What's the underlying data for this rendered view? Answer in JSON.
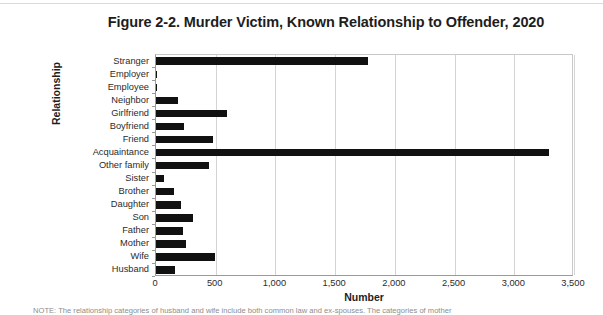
{
  "figure": {
    "title": "Figure 2-2. Murder Victim, Known Relationship to Offender, 2020",
    "note": "NOTE: The relationship categories of husband and wife include both common law and ex-spouses. The categories of mother"
  },
  "chart_data": {
    "type": "bar",
    "orientation": "horizontal",
    "title": "Figure 2-2. Murder Victim, Known Relationship to Offender, 2020",
    "xlabel": "Number",
    "ylabel": "Relationship",
    "xlim": [
      0,
      3500
    ],
    "xticks": [
      0,
      500,
      1000,
      1500,
      2000,
      2500,
      3000,
      3500
    ],
    "xtick_labels": [
      "0",
      "500",
      "1,000",
      "1,500",
      "2,000",
      "2,500",
      "3,000",
      "3,500"
    ],
    "grid": "vertical",
    "legend": "none",
    "bar_color": "#111111",
    "categories": [
      "Stranger",
      "Employer",
      "Employee",
      "Neighbor",
      "Girlfriend",
      "Boyfriend",
      "Friend",
      "Acquaintance",
      "Other family",
      "Sister",
      "Brother",
      "Daughter",
      "Son",
      "Father",
      "Mother",
      "Wife",
      "Husband"
    ],
    "values": [
      1776,
      8,
      6,
      184,
      595,
      235,
      478,
      3292,
      445,
      65,
      148,
      210,
      307,
      225,
      250,
      490,
      160
    ]
  }
}
